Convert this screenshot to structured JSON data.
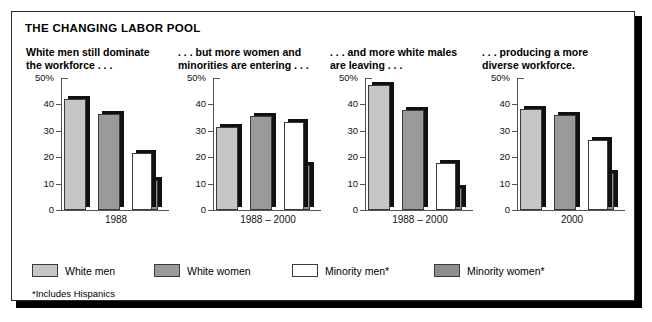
{
  "figure": {
    "title": "THE CHANGING LABOR POOL",
    "footnote": "*Includes Hispanics"
  },
  "legend": {
    "items": [
      {
        "label": "White men",
        "key": "whitemen",
        "color": "#c6c6c6"
      },
      {
        "label": "White women",
        "key": "whitewomen",
        "color": "#9a9a9a"
      },
      {
        "label": "Minority men*",
        "key": "minmen",
        "color": "#ffffff"
      },
      {
        "label": "Minority women*",
        "key": "minwomen",
        "color": "#8e8e8e"
      }
    ]
  },
  "axis": {
    "ticks": [
      "50%",
      "40",
      "30",
      "20",
      "10",
      "0"
    ],
    "ymin": 0,
    "ymax": 50
  },
  "chart_data": {
    "type": "bar",
    "title": "THE CHANGING LABOR POOL",
    "xlabel": "",
    "ylabel": "",
    "ylim": [
      0,
      50
    ],
    "ytick_labels": [
      "50%",
      "40",
      "30",
      "20",
      "10",
      "0"
    ],
    "grid": false,
    "legend_position": "bottom",
    "series_names": [
      "White men",
      "White women",
      "Minority men*",
      "Minority women*"
    ],
    "panels": [
      {
        "heading": "White men still dominate\nthe workforce . . .",
        "category": "1988",
        "categories": [
          "White men",
          "White women",
          "Minority men*",
          "Minority women*"
        ],
        "values": [
          42.0,
          36.5,
          21.5,
          11.5
        ]
      },
      {
        "heading": ". . . but more women and\nminorities are entering . . .",
        "category": "1988 – 2000",
        "categories": [
          "White men",
          "White women",
          "Minority men*",
          "Minority women*"
        ],
        "values": [
          31.5,
          35.5,
          33.5,
          17.0
        ]
      },
      {
        "heading": ". . . and more white males\nare leaving . . .",
        "category": "1988 – 2000",
        "categories": [
          "White men",
          "White women",
          "Minority men*",
          "Minority women*"
        ],
        "values": [
          47.5,
          37.8,
          17.8,
          8.3
        ]
      },
      {
        "heading": ". . . producing a more\ndiverse workforce.",
        "category": "2000",
        "categories": [
          "White men",
          "White women",
          "Minority men*",
          "Minority women*"
        ],
        "values": [
          38.3,
          36.0,
          26.5,
          14.0
        ]
      }
    ]
  }
}
